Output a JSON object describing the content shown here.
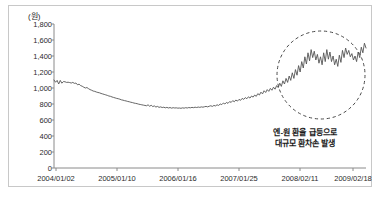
{
  "chart_data": {
    "type": "line",
    "title": "",
    "subtitle": "",
    "xlabel": "",
    "ylabel": "",
    "unit_label": "(원)",
    "ylim": [
      0,
      1800
    ],
    "ytick_values": [
      1800,
      1600,
      1400,
      1200,
      1000,
      800,
      600,
      400,
      200,
      0
    ],
    "ytick_labels": [
      "1,800",
      "1,600",
      "1,400",
      "1,200",
      "1,000",
      "800",
      "600",
      "400",
      "200",
      "0"
    ],
    "xtick_labels": [
      "2004/01/02",
      "2005/01/10",
      "2006/01/16",
      "2007/01/25",
      "2008/02/11",
      "2009/02/18"
    ],
    "grid": false,
    "legend": null,
    "line_color": "#555555",
    "series": [
      {
        "name": "엔-원 환율",
        "values": [
          1100,
          1072,
          1095,
          1050,
          1095,
          1060,
          1080,
          1078,
          1070,
          1072,
          1068,
          1062,
          1070,
          1058,
          1062,
          1040,
          1048,
          1030,
          1022,
          1010,
          1000,
          1006,
          992,
          980,
          972,
          962,
          958,
          950,
          944,
          940,
          932,
          926,
          920,
          914,
          908,
          900,
          896,
          888,
          882,
          876,
          870,
          866,
          860,
          852,
          848,
          842,
          838,
          832,
          828,
          822,
          818,
          812,
          808,
          804,
          798,
          794,
          790,
          786,
          782,
          778,
          790,
          772,
          784,
          768,
          776,
          762,
          770,
          758,
          764,
          756,
          760,
          752,
          758,
          750,
          756,
          748,
          754,
          750,
          752,
          748,
          750,
          746,
          752,
          748,
          754,
          750,
          756,
          752,
          758,
          754,
          760,
          756,
          762,
          758,
          764,
          760,
          766,
          770,
          764,
          772,
          778,
          770,
          782,
          776,
          790,
          782,
          800,
          792,
          812,
          800,
          820,
          808,
          830,
          820,
          842,
          828,
          850,
          836,
          858,
          846,
          870,
          858,
          880,
          866,
          890,
          874,
          900,
          886,
          912,
          896,
          930,
          912,
          948,
          926,
          966,
          944,
          980,
          958,
          995,
          972,
          1010,
          985,
          1030,
          1005,
          1060,
          1020,
          1090,
          1050,
          1120,
          1070,
          1150,
          1095,
          1190,
          1120,
          1230,
          1160,
          1280,
          1200,
          1330,
          1250,
          1390,
          1300,
          1440,
          1340,
          1480,
          1380,
          1460,
          1350,
          1420,
          1310,
          1390,
          1290,
          1440,
          1330,
          1480,
          1360,
          1450,
          1330,
          1400,
          1290,
          1360,
          1270,
          1410,
          1320,
          1470,
          1380,
          1500,
          1420,
          1470,
          1390,
          1430,
          1350,
          1400,
          1330,
          1450,
          1380,
          1510,
          1440,
          1560,
          1500
        ]
      }
    ],
    "annotations": [
      {
        "name": "spike-callout",
        "lines": [
          "엔-원 환율 급등으로",
          "대규모 환차손 발생"
        ],
        "highlight_shape": "dashed-circle"
      }
    ]
  }
}
